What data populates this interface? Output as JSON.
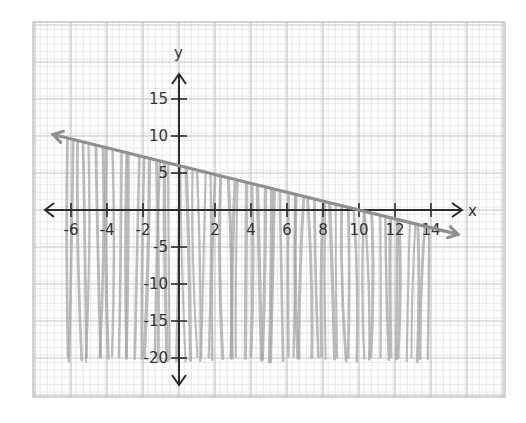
{
  "chart_data": {
    "type": "line",
    "title": "",
    "xlabel": "x",
    "ylabel": "y",
    "xlim": [
      -7,
      16
    ],
    "ylim": [
      -22,
      19
    ],
    "x_ticks": [
      -6,
      -4,
      -2,
      2,
      4,
      6,
      8,
      10,
      12,
      14
    ],
    "y_ticks": [
      15,
      10,
      5,
      -5,
      -10,
      -15,
      -20
    ],
    "x_tick_labels": [
      "-6",
      "-4",
      "-2",
      "2",
      "4",
      "6",
      "8",
      "10",
      "12",
      "14"
    ],
    "y_tick_labels": [
      "15",
      "10",
      "5",
      "-5",
      "-10",
      "-15",
      "-20"
    ],
    "grid": true,
    "series": [
      {
        "name": "boundary line",
        "equation": "y = -0.6x + 6",
        "x": [
          -7,
          0,
          10,
          15.5
        ],
        "y": [
          10.2,
          6,
          0,
          -3.3
        ],
        "arrows": "both",
        "style": "solid"
      }
    ],
    "shaded_region": {
      "description": "region below the line, shaded with vertical pencil strokes",
      "x_range": [
        -6,
        14
      ],
      "y_bottom": -20,
      "inequality": "y <= -0.6x + 6"
    }
  },
  "colors": {
    "grid_minor": "#e2e2e2",
    "grid_major": "#c4c4c4",
    "axis": "#2b2b2b",
    "line": "#8f8f8f",
    "shade": "#a5a5a5"
  }
}
